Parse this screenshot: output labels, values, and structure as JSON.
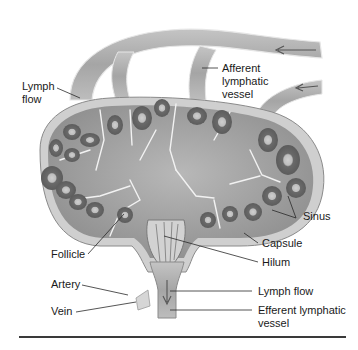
{
  "figure": {
    "labels": {
      "lymph_flow_top": "Lymph\nflow",
      "afferent_vessel": "Afferent\nlymphatic\nvessel",
      "sinus": "Sinus",
      "capsule": "Capsule",
      "hilum": "Hilum",
      "follicle": "Follicle",
      "artery": "Artery",
      "vein": "Vein",
      "lymph_flow_bottom": "Lymph flow",
      "efferent_vessel": "Efferent lymphatic\nvessel"
    },
    "colors": {
      "tissue": "#9a9a9a",
      "capsule": "#c9c9c9",
      "follicle": "#6e6e6e",
      "germinal_center": "#bdbdbd",
      "sinus_line": "#f2f2f2",
      "leader_line": "#2a2a2a"
    }
  }
}
